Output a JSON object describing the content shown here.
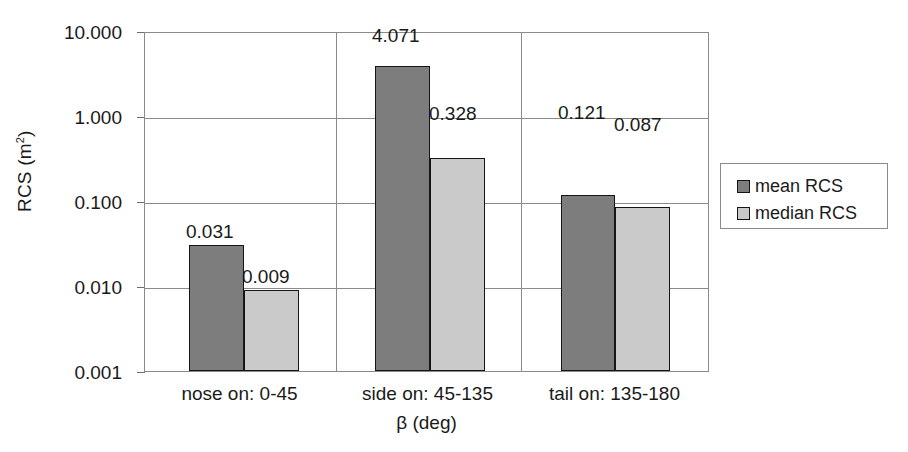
{
  "chart_data": {
    "type": "bar",
    "title": "",
    "xlabel": "β (deg)",
    "ylabel": "RCS (m²)",
    "yscale": "log",
    "ylim": [
      0.001,
      10.0
    ],
    "grid": true,
    "legend_position": "right",
    "categories": [
      "nose on:  0-45",
      "side on: 45-135",
      "tail on: 135-180"
    ],
    "y_tick_labels": [
      "10.000",
      "1.000",
      "0.100",
      "0.010",
      "0.001"
    ],
    "y_tick_values": [
      10.0,
      1.0,
      0.1,
      0.01,
      0.001
    ],
    "series": [
      {
        "name": "mean RCS",
        "color": "#7d7d7d",
        "values": [
          0.031,
          4.071,
          0.121
        ],
        "labels": [
          "0.031",
          "4.071",
          "0.121"
        ]
      },
      {
        "name": "median RCS",
        "color": "#cacaca",
        "values": [
          0.009,
          0.328,
          0.087
        ],
        "labels": [
          "0.009",
          "0.328",
          "0.087"
        ]
      }
    ]
  },
  "axis": {
    "y_title_main": "RCS (m",
    "y_title_sup": "2",
    "y_title_tail": ")",
    "x_title": "β (deg)"
  },
  "legend": {
    "items": [
      {
        "label": "mean RCS"
      },
      {
        "label": "median RCS"
      }
    ]
  }
}
